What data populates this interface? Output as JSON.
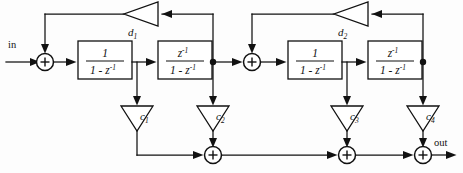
{
  "diagram": {
    "type": "signal-flow-block-diagram",
    "io": {
      "input_label": "in",
      "output_label": "out"
    },
    "blocks": [
      {
        "id": "integrator-1",
        "numerator": "1",
        "denominator_base": "1 - z",
        "denominator_exp": "-1",
        "section": 1
      },
      {
        "id": "delay-integrator-1",
        "numerator_base": "z",
        "numerator_exp": "-1",
        "denominator_base": "1 - z",
        "denominator_exp": "-1",
        "section": 1
      },
      {
        "id": "integrator-2",
        "numerator": "1",
        "denominator_base": "1 - z",
        "denominator_exp": "-1",
        "section": 2
      },
      {
        "id": "delay-integrator-2",
        "numerator_base": "z",
        "numerator_exp": "-1",
        "denominator_base": "1 - z",
        "denominator_exp": "-1",
        "section": 2
      }
    ],
    "feedback_gains": [
      {
        "id": "d1",
        "base": "d",
        "sub": "1",
        "direction": "leftward"
      },
      {
        "id": "d2",
        "base": "d",
        "sub": "2",
        "direction": "leftward"
      }
    ],
    "feedforward_gains": [
      {
        "id": "c1",
        "base": "c",
        "sub": "1",
        "direction": "downward"
      },
      {
        "id": "c2",
        "base": "c",
        "sub": "2",
        "direction": "downward"
      },
      {
        "id": "c3",
        "base": "c",
        "sub": "3",
        "direction": "downward"
      },
      {
        "id": "c4",
        "base": "c",
        "sub": "4",
        "direction": "downward"
      }
    ],
    "summing_nodes": [
      {
        "id": "sum-in-1",
        "symbol": "+",
        "row": "top"
      },
      {
        "id": "sum-in-2",
        "symbol": "+",
        "row": "top"
      },
      {
        "id": "sum-out-1",
        "symbol": "+",
        "row": "bottom"
      },
      {
        "id": "sum-out-2",
        "symbol": "+",
        "row": "bottom"
      },
      {
        "id": "sum-out-3",
        "symbol": "+",
        "row": "bottom"
      }
    ],
    "colors": {
      "line": "#111111",
      "background": "#ffffff"
    }
  }
}
